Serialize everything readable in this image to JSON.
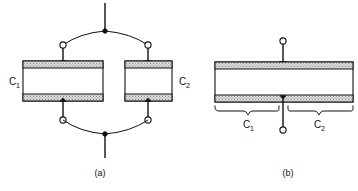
{
  "figure": {
    "background_color": "#ffffff",
    "line_color": "#111111",
    "plate_fill_color": "#d9d9d9",
    "panels": [
      {
        "id": "a",
        "caption": "(a)",
        "description": "two capacitors connected in parallel",
        "capacitors": [
          {
            "id": "c1-left",
            "label": "C",
            "subscript": "1",
            "label_position": "left"
          },
          {
            "id": "c2-right",
            "label": "C",
            "subscript": "2",
            "label_position": "right"
          }
        ],
        "terminals": [
          {
            "name": "top-node",
            "type": "filled-junction"
          },
          {
            "name": "bottom-node",
            "type": "filled-junction"
          },
          {
            "name": "top-left-terminal",
            "type": "open-circle"
          },
          {
            "name": "top-right-terminal",
            "type": "open-circle"
          },
          {
            "name": "bottom-left-terminal",
            "type": "open-circle"
          },
          {
            "name": "bottom-right-terminal",
            "type": "open-circle"
          }
        ]
      },
      {
        "id": "b",
        "caption": "(b)",
        "description": "equivalent single capacitor split into two regions",
        "capacitors": [
          {
            "id": "c1-region",
            "label": "C",
            "subscript": "1",
            "label_position": "under-left"
          },
          {
            "id": "c2-region",
            "label": "C",
            "subscript": "2",
            "label_position": "under-right"
          }
        ],
        "terminals": [
          {
            "name": "top-terminal",
            "type": "open-circle"
          },
          {
            "name": "bottom-terminal",
            "type": "open-circle"
          }
        ],
        "braces": [
          {
            "name": "left-brace",
            "label": "C",
            "subscript": "1"
          },
          {
            "name": "right-brace",
            "label": "C",
            "subscript": "2"
          }
        ]
      }
    ]
  }
}
